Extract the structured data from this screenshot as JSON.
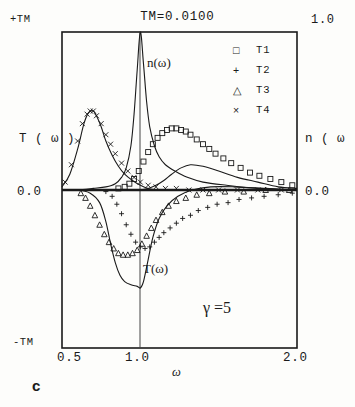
{
  "figure": {
    "panel_label": "c",
    "title": "TM=0.0100",
    "annotation": "γ =5"
  },
  "axes": {
    "left": {
      "label": "T ( ω )",
      "top_tick": "+TM",
      "zero_tick": "0.0",
      "bottom_tick": "-TM"
    },
    "right": {
      "label": "n ( ω",
      "top_tick": "1.0",
      "zero_tick": "0.0"
    },
    "x": {
      "label": "ω",
      "ticks": [
        "0.5",
        "1.0",
        "2.0"
      ]
    }
  },
  "legend": {
    "items": [
      {
        "marker": "square-marker",
        "glyph": "□",
        "label": "T1"
      },
      {
        "marker": "plus-marker",
        "glyph": "+",
        "label": "T2"
      },
      {
        "marker": "triangle-marker",
        "glyph": "△",
        "label": "T3"
      },
      {
        "marker": "cross-marker",
        "glyph": "×",
        "label": "T4"
      }
    ]
  },
  "curve_labels": {
    "n_curve": "n(ω)",
    "T_curve": "T(ω)"
  },
  "chart_data": {
    "type": "line",
    "title": "TM=0.0100",
    "xlabel": "ω",
    "ylabel": "T ( ω )",
    "ylabel_right": "n ( ω )",
    "xlim": [
      0.5,
      2.0
    ],
    "ylim": [
      -1.0,
      1.0
    ],
    "ylim_right": [
      0.0,
      1.0
    ],
    "xticks": [
      0.5,
      1.0,
      2.0
    ],
    "yticks_left": [
      "-TM",
      "0.0",
      "+TM"
    ],
    "yticks_right": [
      "0.0",
      "1.0"
    ],
    "grid": false,
    "gridlines_vertical": [
      1.0
    ],
    "legend_position": "top-right",
    "annotations": [
      {
        "text": "γ =5",
        "x": 1.55,
        "y": -0.72
      },
      {
        "text": "n(ω)",
        "x": 1.07,
        "y": 0.78
      },
      {
        "text": "T(ω)",
        "x": 1.05,
        "y": -0.56
      }
    ],
    "series": [
      {
        "name": "n(ω)",
        "kind": "solid-curve",
        "axis": "right",
        "x": [
          0.5,
          0.6,
          0.7,
          0.78,
          0.84,
          0.88,
          0.91,
          0.94,
          0.96,
          0.98,
          1.0,
          1.02,
          1.04,
          1.06,
          1.09,
          1.12,
          1.16,
          1.22,
          1.3,
          1.4,
          1.55,
          1.75,
          2.0
        ],
        "y": [
          0.0,
          0.0,
          0.01,
          0.02,
          0.04,
          0.08,
          0.14,
          0.28,
          0.48,
          0.76,
          1.0,
          0.8,
          0.56,
          0.4,
          0.28,
          0.21,
          0.16,
          0.12,
          0.08,
          0.05,
          0.03,
          0.01,
          0.0
        ]
      },
      {
        "name": "T(ω)",
        "kind": "solid-curve",
        "axis": "left",
        "x": [
          0.5,
          0.6,
          0.68,
          0.74,
          0.78,
          0.81,
          0.84,
          0.87,
          0.9,
          0.94,
          0.98,
          1.0,
          1.02,
          1.05,
          1.08,
          1.12,
          1.17,
          1.24,
          1.33,
          1.45,
          1.6,
          1.8,
          2.0
        ],
        "y": [
          0.0,
          0.0,
          -0.02,
          -0.08,
          -0.2,
          -0.34,
          -0.46,
          -0.54,
          -0.58,
          -0.6,
          -0.61,
          -0.62,
          -0.58,
          -0.44,
          -0.3,
          -0.18,
          -0.1,
          -0.04,
          0.0,
          0.02,
          0.02,
          0.01,
          0.0
        ]
      },
      {
        "name": "T4-envelope",
        "kind": "solid-curve",
        "axis": "left",
        "x": [
          0.5,
          0.55,
          0.6,
          0.64,
          0.67,
          0.7,
          0.72,
          0.75,
          0.78,
          0.82,
          0.86,
          0.9,
          0.95,
          1.0,
          1.05,
          1.12,
          1.2,
          1.35,
          1.55,
          1.8,
          2.0
        ],
        "y": [
          0.02,
          0.1,
          0.26,
          0.42,
          0.49,
          0.5,
          0.47,
          0.4,
          0.31,
          0.22,
          0.15,
          0.1,
          0.06,
          0.03,
          0.01,
          0.0,
          0.0,
          0.0,
          0.0,
          0.0,
          0.0
        ]
      },
      {
        "name": "T1-envelope",
        "kind": "solid-curve",
        "axis": "left",
        "x": [
          1.0,
          1.05,
          1.1,
          1.15,
          1.2,
          1.26,
          1.32,
          1.4,
          1.5,
          1.62,
          1.75,
          1.88,
          2.0
        ],
        "y": [
          0.0,
          0.01,
          0.03,
          0.06,
          0.1,
          0.14,
          0.16,
          0.15,
          0.12,
          0.08,
          0.05,
          0.02,
          0.01
        ]
      },
      {
        "name": "T1",
        "marker": "□",
        "kind": "markers",
        "axis": "left",
        "x": [
          0.86,
          0.9,
          0.93,
          0.96,
          0.99,
          1.02,
          1.05,
          1.08,
          1.11,
          1.14,
          1.17,
          1.2,
          1.23,
          1.26,
          1.29,
          1.32,
          1.36,
          1.4,
          1.44,
          1.48,
          1.53,
          1.58,
          1.64,
          1.7,
          1.76,
          1.83,
          1.9,
          1.97
        ],
        "y": [
          0.01,
          0.02,
          0.04,
          0.07,
          0.12,
          0.18,
          0.24,
          0.29,
          0.33,
          0.36,
          0.38,
          0.39,
          0.39,
          0.38,
          0.37,
          0.35,
          0.32,
          0.29,
          0.26,
          0.23,
          0.2,
          0.17,
          0.14,
          0.11,
          0.09,
          0.07,
          0.05,
          0.03
        ]
      },
      {
        "name": "T2",
        "marker": "+",
        "kind": "markers",
        "axis": "left",
        "x": [
          0.78,
          0.82,
          0.85,
          0.88,
          0.91,
          0.94,
          0.97,
          1.0,
          1.03,
          1.06,
          1.09,
          1.12,
          1.15,
          1.19,
          1.23,
          1.27,
          1.32,
          1.37,
          1.43,
          1.49,
          1.56,
          1.63,
          1.71,
          1.79,
          1.88,
          1.97
        ],
        "y": [
          -0.01,
          -0.04,
          -0.09,
          -0.15,
          -0.22,
          -0.28,
          -0.33,
          -0.36,
          -0.37,
          -0.36,
          -0.33,
          -0.3,
          -0.27,
          -0.24,
          -0.21,
          -0.18,
          -0.16,
          -0.13,
          -0.11,
          -0.09,
          -0.08,
          -0.06,
          -0.05,
          -0.04,
          -0.03,
          -0.02
        ]
      },
      {
        "name": "T3",
        "marker": "△",
        "kind": "markers",
        "axis": "left",
        "x": [
          0.62,
          0.65,
          0.68,
          0.71,
          0.74,
          0.77,
          0.8,
          0.83,
          0.86,
          0.89,
          0.92,
          0.95,
          0.98,
          1.01,
          1.04,
          1.07,
          1.1,
          1.14,
          1.18,
          1.23,
          1.29,
          1.36,
          1.44,
          1.54,
          1.66,
          1.8,
          1.95
        ],
        "y": [
          -0.02,
          -0.05,
          -0.1,
          -0.16,
          -0.22,
          -0.28,
          -0.33,
          -0.37,
          -0.4,
          -0.41,
          -0.41,
          -0.4,
          -0.38,
          -0.34,
          -0.29,
          -0.24,
          -0.19,
          -0.14,
          -0.1,
          -0.07,
          -0.05,
          -0.03,
          -0.02,
          -0.01,
          -0.01,
          0.0,
          0.0
        ]
      },
      {
        "name": "T4",
        "marker": "×",
        "kind": "markers",
        "axis": "left",
        "x": [
          0.52,
          0.56,
          0.6,
          0.63,
          0.66,
          0.68,
          0.7,
          0.72,
          0.75,
          0.78,
          0.81,
          0.84,
          0.88,
          0.92,
          0.96,
          1.0,
          1.05,
          1.1,
          1.16,
          1.23,
          1.31,
          1.4,
          1.5,
          1.62,
          1.75,
          1.9
        ],
        "y": [
          0.05,
          0.16,
          0.31,
          0.42,
          0.48,
          0.5,
          0.5,
          0.47,
          0.42,
          0.35,
          0.29,
          0.23,
          0.17,
          0.12,
          0.08,
          0.05,
          0.03,
          0.02,
          0.01,
          0.01,
          0.0,
          0.0,
          0.0,
          0.0,
          0.0,
          0.0
        ]
      }
    ]
  }
}
